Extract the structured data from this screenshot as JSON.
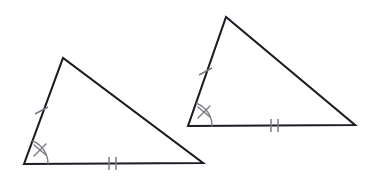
{
  "figure": {
    "kind": "congruent-triangles-diagram",
    "background_color": "#ffffff",
    "edge_color": "#1c1c24",
    "mark_color": "#7b7b84",
    "canvas": {
      "width": 380,
      "height": 180
    },
    "triangles": [
      {
        "id": "left-triangle",
        "label": "left triangle",
        "vertices": {
          "bottom_left": {
            "x": 24,
            "y": 164
          },
          "apex": {
            "x": 63,
            "y": 58
          },
          "bottom_right": {
            "x": 203,
            "y": 163
          }
        },
        "path": "M 24 164 L 63 58 L 203 163 Z",
        "marks": {
          "left_side_ticks": {
            "count": 1,
            "label": "single tick on left side",
            "segments": [
              {
                "x1": 35,
                "y1": 114,
                "x2": 48,
                "y2": 107
              }
            ]
          },
          "base_ticks": {
            "count": 2,
            "label": "double tick on base",
            "segments": [
              {
                "x1": 109,
                "y1": 157,
                "x2": 109,
                "y2": 170
              },
              {
                "x1": 116,
                "y1": 157,
                "x2": 116,
                "y2": 170
              }
            ]
          },
          "angle_arc": {
            "label": "angle arc at bottom-left vertex",
            "path": "M 48 163.6 A 24 24 0 0 0 32.7 141.2"
          },
          "angle_x_mark": {
            "label": "x mark on angle arc",
            "segments": [
              {
                "x1": 34,
                "y1": 145,
                "x2": 46,
                "y2": 155
              },
              {
                "x1": 46,
                "y1": 144,
                "x2": 34,
                "y2": 156
              }
            ]
          }
        }
      },
      {
        "id": "right-triangle",
        "label": "right triangle",
        "vertices": {
          "bottom_left": {
            "x": 188,
            "y": 126
          },
          "apex": {
            "x": 226,
            "y": 17
          },
          "bottom_right": {
            "x": 355,
            "y": 125
          }
        },
        "path": "M 188 126 L 226 17 L 355 125 Z",
        "marks": {
          "left_side_ticks": {
            "count": 1,
            "label": "single tick on left side",
            "segments": [
              {
                "x1": 199,
                "y1": 75,
                "x2": 212,
                "y2": 68
              }
            ]
          },
          "base_ticks": {
            "count": 2,
            "label": "double tick on base",
            "segments": [
              {
                "x1": 271,
                "y1": 119,
                "x2": 271,
                "y2": 132
              },
              {
                "x1": 278,
                "y1": 119,
                "x2": 278,
                "y2": 132
              }
            ]
          },
          "angle_arc": {
            "label": "angle arc at bottom-left vertex",
            "path": "M 212 125.7 A 24 24 0 0 0 196.6 103.4"
          },
          "angle_x_mark": {
            "label": "x mark on angle arc",
            "segments": [
              {
                "x1": 198,
                "y1": 107,
                "x2": 210,
                "y2": 117
              },
              {
                "x1": 210,
                "y1": 106,
                "x2": 198,
                "y2": 118
              }
            ]
          }
        }
      }
    ]
  }
}
